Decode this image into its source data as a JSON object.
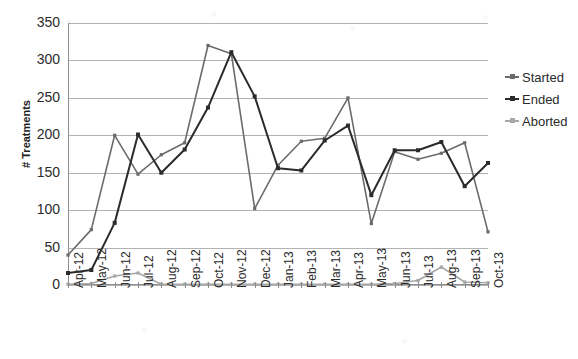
{
  "chart_data": {
    "type": "line",
    "title": "",
    "xlabel": "",
    "ylabel": "# Treatments",
    "ylim": [
      0,
      350
    ],
    "ytick_step": 50,
    "yticks": [
      350,
      300,
      250,
      200,
      150,
      100,
      50,
      0
    ],
    "grid": true,
    "legend_position": "right",
    "categories": [
      "Apr-12",
      "May-12",
      "Jun-12",
      "Jul-12",
      "Aug-12",
      "Sep-12",
      "Oct-12",
      "Nov-12",
      "Dec-12",
      "Jan-13",
      "Feb-13",
      "Mar-13",
      "Apr-13",
      "May-13",
      "Jun-13",
      "Jul-13",
      "Aug-13",
      "Sep-13",
      "Oct-13"
    ],
    "series": [
      {
        "name": "Started",
        "color": "#6b6b6b",
        "values": [
          40,
          74,
          200,
          148,
          174,
          190,
          320,
          309,
          102,
          160,
          192,
          196,
          250,
          82,
          178,
          168,
          176,
          190,
          71
        ]
      },
      {
        "name": "Ended",
        "color": "#2b2b2b",
        "values": [
          16,
          20,
          83,
          201,
          150,
          181,
          237,
          311,
          252,
          156,
          153,
          193,
          213,
          120,
          180,
          180,
          191,
          132,
          163
        ]
      },
      {
        "name": "Aborted",
        "color": "#a8a8a8",
        "values": [
          1,
          2,
          12,
          16,
          1,
          1,
          1,
          1,
          1,
          1,
          1,
          1,
          1,
          1,
          2,
          6,
          24,
          4,
          3
        ]
      }
    ]
  },
  "legend": {
    "items": [
      {
        "label": "Started",
        "color": "#6b6b6b"
      },
      {
        "label": "Ended",
        "color": "#2b2b2b"
      },
      {
        "label": "Aborted",
        "color": "#a8a8a8"
      }
    ]
  },
  "axes": {
    "y_title": "# Treatments"
  }
}
